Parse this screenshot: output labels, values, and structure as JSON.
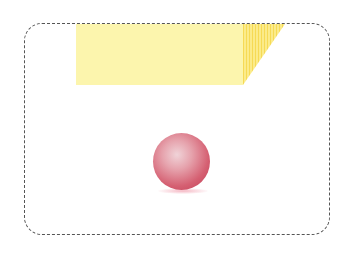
{
  "diagram": {
    "frame": {
      "style": "dashed rounded rectangle",
      "color": "#555555"
    },
    "block": {
      "shape": "yellow 3D box (top front + slanted side)",
      "front_color": "#fbf3a6",
      "side_color": "#f8e36a"
    },
    "ball": {
      "shape": "red sphere",
      "color": "#d05068",
      "shadow_color": "#f5b8c4"
    }
  }
}
